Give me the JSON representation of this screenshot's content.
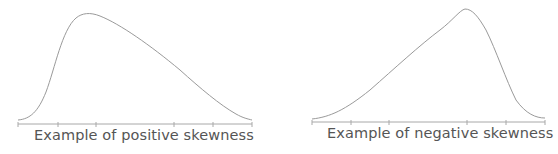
{
  "figures": [
    {
      "caption": "Example of positive skewness",
      "curve_path": "M 18 120 C 30 119, 38 112, 46 92 C 55 68, 62 30, 76 18 C 82 13, 90 12, 100 16 C 120 24, 150 45, 180 70 C 200 88, 220 105, 236 114 C 243 118, 248 119, 252 120",
      "axis": {
        "x1": 18,
        "x2": 252,
        "y": 124
      },
      "ticks": [
        18,
        58,
        96,
        174,
        213,
        252
      ]
    },
    {
      "caption": "Example of negative skewness",
      "curve_path": "M 312 119 C 330 117, 345 110, 370 90 C 395 68, 420 45, 440 30 C 452 21, 460 10, 465 9 C 472 9, 478 16, 486 30 C 496 50, 506 80, 516 100 C 526 114, 536 118, 545 118",
      "axis": {
        "x1": 312,
        "x2": 545,
        "y": 122
      },
      "ticks": [
        312,
        351,
        389,
        467,
        506,
        545
      ]
    }
  ],
  "colors": {
    "curve": "#9a9a9a",
    "axis": "#a8a8a8",
    "text": "#555555"
  }
}
